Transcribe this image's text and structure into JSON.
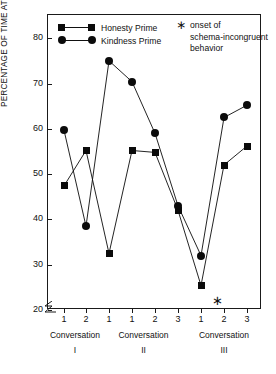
{
  "chart_data": {
    "type": "line",
    "title": "",
    "xlabel": "",
    "ylabel": "PERCENTAGE OF TIME ATTENDING TO PRIMED ACTOR",
    "ylim": [
      20,
      85
    ],
    "yticks": [
      20,
      30,
      40,
      50,
      60,
      70,
      80
    ],
    "ytick_labels": [
      "20",
      "30",
      "40",
      "50",
      "60",
      "70",
      "80"
    ],
    "y_axis_break": true,
    "grid": false,
    "legend_position": "top-left",
    "x": [
      1,
      2,
      3,
      4,
      5,
      6,
      7,
      8,
      9
    ],
    "categories": [
      "1",
      "2",
      "1",
      "1",
      "2",
      "3",
      "1",
      "2",
      "3"
    ],
    "groups": [
      {
        "label": "Conversation",
        "numeral": "I",
        "ticks": [
          "1",
          "2"
        ]
      },
      {
        "label": "Conversation",
        "numeral": "II",
        "ticks": [
          "1",
          "1",
          "2",
          "3"
        ]
      },
      {
        "label": "Conversation",
        "numeral": "III",
        "ticks": [
          "1",
          "2",
          "3"
        ]
      }
    ],
    "series": [
      {
        "name": "Honesty Prime",
        "marker": "square",
        "values": [
          47.4,
          55.2,
          32.5,
          55.2,
          54.8,
          42.0,
          25.4,
          52.0,
          56.2
        ]
      },
      {
        "name": "Kindness Prime",
        "marker": "circle",
        "values": [
          59.7,
          38.5,
          75.0,
          70.4,
          59.0,
          43.0,
          32.0,
          62.5,
          65.2
        ]
      }
    ],
    "annotations": [
      {
        "symbol": "∗",
        "text_lines": [
          "onset of",
          "schema-incongruent",
          "behavior"
        ],
        "marker_x_index": 7,
        "marker_on_axis": true
      }
    ],
    "colors": {
      "series": "#0b0b0b",
      "axis": "#1a1a1a",
      "background": "#ffffff"
    }
  },
  "legend": {
    "items": [
      {
        "label": "Honesty Prime",
        "marker": "square"
      },
      {
        "label": "Kindness Prime",
        "marker": "circle"
      }
    ]
  },
  "note": {
    "symbol": "∗",
    "lines": [
      "onset of",
      "schema-incongruent",
      "behavior"
    ]
  }
}
